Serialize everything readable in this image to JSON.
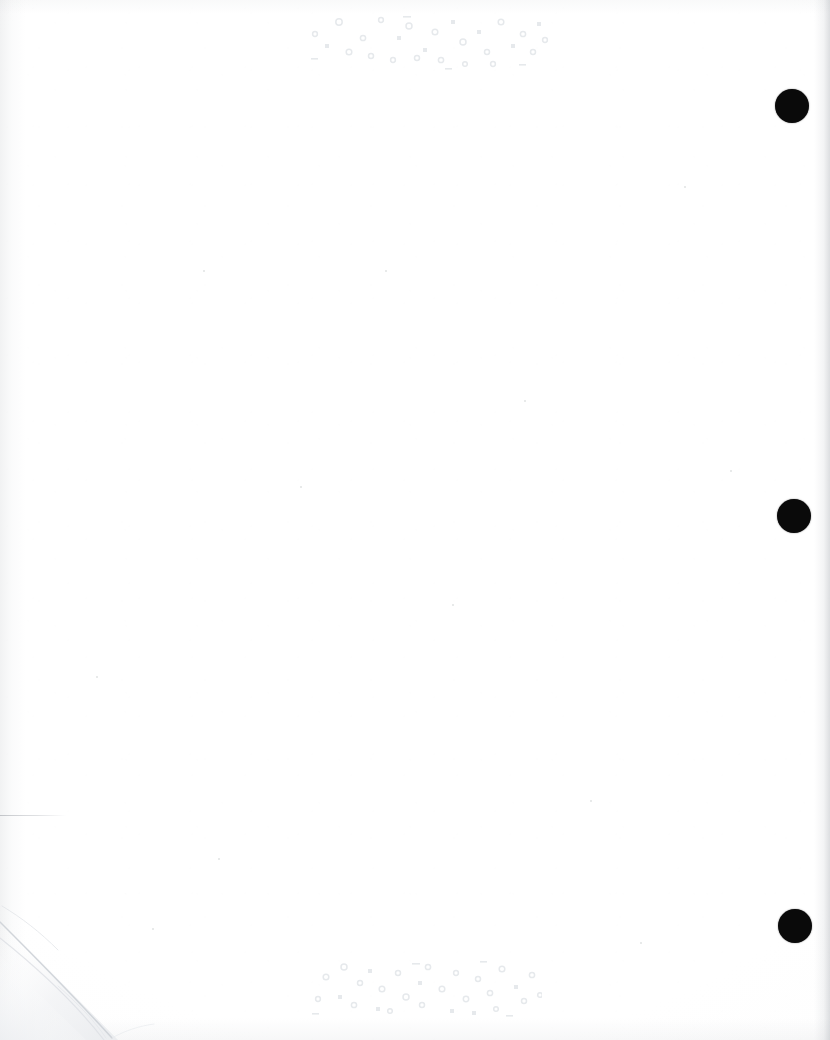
{
  "page": {
    "kind": "scanned-blank-page",
    "width": 830,
    "height": 1040,
    "background_color": "#ffffff",
    "paper_tone": "#fdfdfd"
  },
  "registration_marks": {
    "label": "registration-dots",
    "color": "#0a0a0a",
    "count": 3,
    "dots": [
      {
        "id": "dot-top",
        "cx": 792,
        "cy": 106,
        "d": 34
      },
      {
        "id": "dot-middle",
        "cx": 794,
        "cy": 516,
        "d": 34
      },
      {
        "id": "dot-bottom",
        "cx": 795,
        "cy": 926,
        "d": 34
      }
    ]
  },
  "bleed_through": {
    "label": "reverse-side-ghost-text",
    "color": "#e6e9ec",
    "clusters": [
      {
        "id": "cluster-top",
        "x": 305,
        "y": 8,
        "width": 245,
        "height": 62,
        "marks": [
          {
            "t": "ring",
            "x": 34,
            "y": 14,
            "r": 3.2
          },
          {
            "t": "ring",
            "x": 58,
            "y": 30,
            "r": 2.6
          },
          {
            "t": "sq",
            "x": 20,
            "y": 36,
            "w": 4,
            "h": 4
          },
          {
            "t": "ring",
            "x": 76,
            "y": 12,
            "r": 2.4
          },
          {
            "t": "ring",
            "x": 44,
            "y": 44,
            "r": 2.8
          },
          {
            "t": "sq",
            "x": 92,
            "y": 28,
            "w": 4,
            "h": 4
          },
          {
            "t": "ring",
            "x": 66,
            "y": 48,
            "r": 2.5
          },
          {
            "t": "ring",
            "x": 104,
            "y": 18,
            "r": 3.0
          },
          {
            "t": "sq",
            "x": 118,
            "y": 40,
            "w": 4,
            "h": 4
          },
          {
            "t": "ring",
            "x": 88,
            "y": 52,
            "r": 2.4
          },
          {
            "t": "ring",
            "x": 130,
            "y": 24,
            "r": 2.8
          },
          {
            "t": "ring",
            "x": 112,
            "y": 50,
            "r": 2.5
          },
          {
            "t": "sq",
            "x": 146,
            "y": 12,
            "w": 4,
            "h": 4
          },
          {
            "t": "ring",
            "x": 158,
            "y": 34,
            "r": 3.0
          },
          {
            "t": "ring",
            "x": 136,
            "y": 52,
            "r": 2.6
          },
          {
            "t": "sq",
            "x": 172,
            "y": 22,
            "w": 4,
            "h": 4
          },
          {
            "t": "ring",
            "x": 182,
            "y": 44,
            "r": 2.5
          },
          {
            "t": "ring",
            "x": 160,
            "y": 56,
            "r": 2.3
          },
          {
            "t": "ring",
            "x": 196,
            "y": 14,
            "r": 2.8
          },
          {
            "t": "sq",
            "x": 206,
            "y": 36,
            "w": 4,
            "h": 4
          },
          {
            "t": "ring",
            "x": 188,
            "y": 56,
            "r": 2.4
          },
          {
            "t": "ring",
            "x": 218,
            "y": 26,
            "r": 2.6
          },
          {
            "t": "sq",
            "x": 232,
            "y": 14,
            "w": 4,
            "h": 4
          },
          {
            "t": "ring",
            "x": 228,
            "y": 44,
            "r": 2.5
          },
          {
            "t": "dash",
            "x": 6,
            "y": 50,
            "w": 7,
            "h": 1.6
          },
          {
            "t": "dash",
            "x": 98,
            "y": 8,
            "w": 8,
            "h": 1.6
          },
          {
            "t": "dash",
            "x": 140,
            "y": 60,
            "w": 7,
            "h": 1.6
          },
          {
            "t": "dash",
            "x": 214,
            "y": 56,
            "w": 7,
            "h": 1.6
          },
          {
            "t": "ring",
            "x": 10,
            "y": 26,
            "r": 2.4
          },
          {
            "t": "ring",
            "x": 240,
            "y": 32,
            "r": 2.4
          }
        ]
      },
      {
        "id": "cluster-bottom",
        "x": 310,
        "y": 955,
        "width": 232,
        "height": 62,
        "marks": [
          {
            "t": "ring",
            "x": 16,
            "y": 22,
            "r": 2.8
          },
          {
            "t": "ring",
            "x": 34,
            "y": 12,
            "r": 3.0
          },
          {
            "t": "sq",
            "x": 28,
            "y": 40,
            "w": 4,
            "h": 4
          },
          {
            "t": "ring",
            "x": 50,
            "y": 28,
            "r": 2.5
          },
          {
            "t": "ring",
            "x": 8,
            "y": 44,
            "r": 2.4
          },
          {
            "t": "sq",
            "x": 58,
            "y": 14,
            "w": 4,
            "h": 4
          },
          {
            "t": "ring",
            "x": 44,
            "y": 50,
            "r": 2.6
          },
          {
            "t": "ring",
            "x": 72,
            "y": 34,
            "r": 2.8
          },
          {
            "t": "sq",
            "x": 66,
            "y": 52,
            "w": 4,
            "h": 4
          },
          {
            "t": "ring",
            "x": 88,
            "y": 18,
            "r": 2.5
          },
          {
            "t": "ring",
            "x": 96,
            "y": 42,
            "r": 3.0
          },
          {
            "t": "ring",
            "x": 80,
            "y": 56,
            "r": 2.3
          },
          {
            "t": "sq",
            "x": 108,
            "y": 26,
            "w": 4,
            "h": 4
          },
          {
            "t": "ring",
            "x": 118,
            "y": 12,
            "r": 2.6
          },
          {
            "t": "ring",
            "x": 112,
            "y": 50,
            "r": 2.5
          },
          {
            "t": "ring",
            "x": 132,
            "y": 34,
            "r": 2.8
          },
          {
            "t": "sq",
            "x": 140,
            "y": 54,
            "w": 4,
            "h": 4
          },
          {
            "t": "ring",
            "x": 146,
            "y": 18,
            "r": 2.4
          },
          {
            "t": "ring",
            "x": 156,
            "y": 44,
            "r": 2.7
          },
          {
            "t": "ring",
            "x": 168,
            "y": 24,
            "r": 2.5
          },
          {
            "t": "sq",
            "x": 162,
            "y": 56,
            "w": 4,
            "h": 4
          },
          {
            "t": "ring",
            "x": 180,
            "y": 38,
            "r": 2.6
          },
          {
            "t": "ring",
            "x": 192,
            "y": 14,
            "r": 2.8
          },
          {
            "t": "ring",
            "x": 186,
            "y": 54,
            "r": 2.3
          },
          {
            "t": "sq",
            "x": 204,
            "y": 30,
            "w": 4,
            "h": 4
          },
          {
            "t": "ring",
            "x": 214,
            "y": 46,
            "r": 2.5
          },
          {
            "t": "ring",
            "x": 222,
            "y": 20,
            "r": 2.6
          },
          {
            "t": "dash",
            "x": 102,
            "y": 8,
            "w": 8,
            "h": 1.6
          },
          {
            "t": "dash",
            "x": 2,
            "y": 58,
            "w": 7,
            "h": 1.6
          },
          {
            "t": "dash",
            "x": 196,
            "y": 60,
            "w": 7,
            "h": 1.6
          },
          {
            "t": "dash",
            "x": 170,
            "y": 6,
            "w": 7,
            "h": 1.6
          },
          {
            "t": "ring",
            "x": 230,
            "y": 40,
            "r": 2.3
          }
        ]
      }
    ]
  },
  "folded_corner": {
    "label": "bottom-left-folded-corner",
    "crease_color": "#d7dade",
    "shade_color": "#f4f5f7"
  },
  "hairline": {
    "label": "faint-horizontal-mark",
    "x": 0,
    "y": 815,
    "width": 66,
    "height": 1.4,
    "color": "#7d828a"
  },
  "specks": [
    {
      "x": 203,
      "y": 270,
      "d": 2
    },
    {
      "x": 385,
      "y": 270,
      "d": 2
    },
    {
      "x": 524,
      "y": 400,
      "d": 2
    },
    {
      "x": 590,
      "y": 800,
      "d": 2
    },
    {
      "x": 452,
      "y": 604,
      "d": 2
    },
    {
      "x": 218,
      "y": 858,
      "d": 2
    },
    {
      "x": 152,
      "y": 928,
      "d": 2
    },
    {
      "x": 684,
      "y": 186,
      "d": 2
    },
    {
      "x": 730,
      "y": 470,
      "d": 2
    },
    {
      "x": 96,
      "y": 676,
      "d": 2
    },
    {
      "x": 640,
      "y": 942,
      "d": 2
    },
    {
      "x": 300,
      "y": 486,
      "d": 2
    }
  ]
}
